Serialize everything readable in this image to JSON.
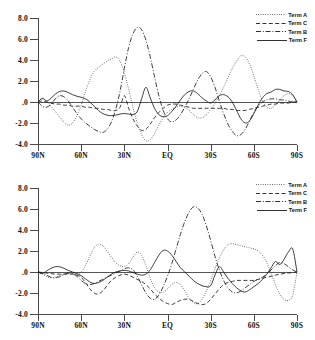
{
  "chart_data": [
    {
      "type": "line",
      "panel": "top",
      "title": "",
      "xlabel": "",
      "ylabel": "",
      "grid": false,
      "legend_position": "top-right",
      "ylim": [
        -4.0,
        8.0
      ],
      "yticks": [
        "8.0",
        "6.0",
        "4.0",
        "2.0",
        ".0",
        "-2.0",
        "-4.0"
      ],
      "ytick_values": [
        8.0,
        6.0,
        4.0,
        2.0,
        0.0,
        -2.0,
        -4.0
      ],
      "xticks": [
        "90N",
        "60N",
        "30N",
        "EQ",
        "30S",
        "60S",
        "90S"
      ],
      "xtick_values": [
        90,
        60,
        30,
        0,
        -30,
        -60,
        -90
      ],
      "x": [
        90,
        87,
        84,
        81,
        78,
        75,
        72,
        69,
        66,
        63,
        60,
        57,
        54,
        51,
        48,
        45,
        42,
        39,
        36,
        33,
        30,
        27,
        24,
        21,
        18,
        15,
        12,
        9,
        6,
        3,
        0,
        -3,
        -6,
        -9,
        -12,
        -15,
        -18,
        -21,
        -24,
        -27,
        -30,
        -33,
        -36,
        -39,
        -42,
        -45,
        -48,
        -51,
        -54,
        -57,
        -60,
        -63,
        -66,
        -69,
        -72,
        -75,
        -78,
        -81,
        -84,
        -87,
        -90
      ],
      "series": [
        {
          "name": "Term A",
          "style": "dotted",
          "values": [
            0.0,
            0.3,
            0.1,
            -0.4,
            -0.9,
            -1.4,
            -1.9,
            -2.2,
            -2.0,
            -1.3,
            -0.3,
            1.0,
            2.1,
            2.9,
            3.3,
            3.6,
            3.9,
            4.1,
            4.3,
            3.9,
            2.8,
            1.2,
            -0.5,
            -2.0,
            -3.1,
            -3.7,
            -3.6,
            -3.0,
            -2.2,
            -1.5,
            -1.0,
            -0.7,
            -0.5,
            -0.4,
            -0.5,
            -0.8,
            -1.2,
            -1.5,
            -1.5,
            -1.2,
            -0.7,
            -0.1,
            0.6,
            1.4,
            2.3,
            3.2,
            3.9,
            4.4,
            4.3,
            3.6,
            2.5,
            1.2,
            0.1,
            -0.5,
            -0.6,
            -0.3,
            0.2,
            0.6,
            0.8,
            0.6,
            0.0
          ]
        },
        {
          "name": "Term C",
          "style": "dashed",
          "values": [
            0.0,
            0.1,
            0.0,
            -0.1,
            -0.2,
            -0.2,
            -0.3,
            -0.3,
            -0.4,
            -0.4,
            -0.4,
            -0.5,
            -0.5,
            -0.6,
            -0.6,
            -0.7,
            -0.7,
            -0.8,
            -0.8,
            -0.5,
            0.6,
            -0.6,
            -1.6,
            -2.3,
            -2.7,
            -2.6,
            -2.1,
            -1.5,
            -1.0,
            -0.6,
            -0.3,
            -0.2,
            -0.2,
            -0.3,
            -0.4,
            -0.5,
            -0.6,
            -0.6,
            -0.6,
            -0.6,
            -0.6,
            -0.6,
            -0.6,
            -0.6,
            -0.7,
            -0.7,
            -0.8,
            -0.8,
            -0.8,
            -0.7,
            -0.6,
            -0.5,
            -0.4,
            -0.3,
            -0.2,
            -0.2,
            -0.1,
            -0.1,
            -0.1,
            0.0,
            0.0
          ]
        },
        {
          "name": "Term B",
          "style": "dashdot",
          "values": [
            0.0,
            -0.4,
            -0.5,
            -0.2,
            0.3,
            0.6,
            0.5,
            0.1,
            -0.5,
            -1.1,
            -1.6,
            -2.0,
            -2.3,
            -2.6,
            -2.8,
            -2.9,
            -2.6,
            -1.9,
            -0.7,
            1.0,
            3.2,
            5.2,
            6.5,
            7.1,
            6.9,
            5.9,
            4.3,
            2.4,
            0.6,
            -0.8,
            -1.6,
            -1.9,
            -1.7,
            -1.2,
            -0.5,
            0.3,
            1.2,
            2.1,
            2.7,
            2.9,
            2.4,
            1.4,
            0.1,
            -1.1,
            -2.1,
            -2.8,
            -3.2,
            -3.1,
            -2.6,
            -1.8,
            -1.0,
            -0.4,
            0.0,
            0.2,
            0.3,
            0.3,
            0.2,
            0.2,
            0.1,
            0.0,
            0.0
          ]
        },
        {
          "name": "Term F",
          "style": "solid",
          "values": [
            0.0,
            0.35,
            0.1,
            0.35,
            0.75,
            1.0,
            1.05,
            0.9,
            0.7,
            0.55,
            0.45,
            0.3,
            0.0,
            -0.4,
            -0.8,
            -1.1,
            -1.25,
            -1.3,
            -1.25,
            -1.15,
            -1.1,
            -1.15,
            -1.2,
            -0.9,
            0.3,
            1.4,
            0.4,
            -0.6,
            -1.2,
            -1.4,
            -1.3,
            -0.9,
            -0.4,
            0.2,
            0.7,
            1.0,
            1.05,
            0.8,
            0.4,
            0.1,
            -0.1,
            0.2,
            0.6,
            0.7,
            0.5,
            0.0,
            -0.8,
            -1.6,
            -2.0,
            -1.8,
            -1.1,
            -0.3,
            0.4,
            0.8,
            0.95,
            1.2,
            1.2,
            1.05,
            1.0,
            0.7,
            0.0
          ]
        }
      ]
    },
    {
      "type": "line",
      "panel": "bottom",
      "title": "",
      "xlabel": "",
      "ylabel": "",
      "grid": false,
      "legend_position": "top-right",
      "ylim": [
        -4.0,
        8.0
      ],
      "yticks": [
        "8.0",
        "6.0",
        "4.0",
        "2.0",
        ".0",
        "-2.0",
        "-4.0"
      ],
      "ytick_values": [
        8.0,
        6.0,
        4.0,
        2.0,
        0.0,
        -2.0,
        -4.0
      ],
      "xticks": [
        "90N",
        "60N",
        "30N",
        "EQ",
        "30S",
        "60S",
        "90S"
      ],
      "xtick_values": [
        90,
        60,
        30,
        0,
        -30,
        -60,
        -90
      ],
      "x": [
        90,
        87,
        84,
        81,
        78,
        75,
        72,
        69,
        66,
        63,
        60,
        57,
        54,
        51,
        48,
        45,
        42,
        39,
        36,
        33,
        30,
        27,
        24,
        21,
        18,
        15,
        12,
        9,
        6,
        3,
        0,
        -3,
        -6,
        -9,
        -12,
        -15,
        -18,
        -21,
        -24,
        -27,
        -30,
        -33,
        -36,
        -39,
        -42,
        -45,
        -48,
        -51,
        -54,
        -57,
        -60,
        -63,
        -66,
        -69,
        -72,
        -75,
        -78,
        -81,
        -84,
        -87,
        -90
      ],
      "series": [
        {
          "name": "Term A",
          "style": "dotted",
          "values": [
            0.0,
            -0.2,
            -0.45,
            -0.55,
            -0.5,
            -0.35,
            -0.2,
            -0.15,
            -0.2,
            -0.2,
            0.0,
            0.6,
            1.5,
            2.3,
            2.65,
            2.5,
            2.0,
            1.4,
            0.9,
            0.6,
            0.5,
            0.8,
            1.4,
            1.9,
            1.6,
            0.6,
            -0.6,
            -1.5,
            -1.9,
            -1.9,
            -1.6,
            -1.2,
            -1.0,
            -1.2,
            -1.8,
            -2.5,
            -2.9,
            -3.0,
            -2.6,
            -1.8,
            -0.8,
            0.3,
            1.3,
            2.1,
            2.6,
            2.7,
            2.6,
            2.5,
            2.4,
            2.3,
            2.2,
            2.0,
            1.6,
            0.9,
            -0.1,
            -1.2,
            -2.1,
            -2.6,
            -2.7,
            -2.2,
            0.0
          ]
        },
        {
          "name": "Term C",
          "style": "dashed",
          "values": [
            0.0,
            -0.05,
            -0.1,
            -0.15,
            -0.2,
            -0.2,
            -0.2,
            -0.2,
            -0.2,
            -0.3,
            -0.5,
            -1.0,
            -1.6,
            -2.0,
            -2.1,
            -1.8,
            -1.3,
            -0.8,
            -0.5,
            -0.3,
            -0.2,
            -0.3,
            -0.5,
            -0.7,
            -0.9,
            -1.2,
            -1.6,
            -2.1,
            -2.5,
            -2.8,
            -3.0,
            -3.1,
            -2.9,
            -2.7,
            -2.6,
            -2.6,
            -2.8,
            -3.0,
            -3.1,
            -3.0,
            -2.6,
            -2.1,
            -1.6,
            -1.2,
            -1.0,
            -0.9,
            -0.8,
            -0.8,
            -0.8,
            -0.8,
            -0.8,
            -0.7,
            -0.6,
            -0.5,
            -0.4,
            -0.3,
            -0.2,
            -0.15,
            -0.1,
            -0.05,
            0.0
          ]
        },
        {
          "name": "Term B",
          "style": "dashdot",
          "values": [
            0.0,
            -0.1,
            -0.3,
            -0.5,
            -0.55,
            -0.45,
            -0.25,
            -0.1,
            -0.15,
            -0.4,
            -0.8,
            -1.1,
            -1.2,
            -1.1,
            -0.9,
            -0.7,
            -0.5,
            -0.3,
            -0.1,
            0.1,
            0.3,
            0.4,
            0.2,
            -0.4,
            -1.2,
            -2.0,
            -2.5,
            -2.6,
            -2.2,
            -1.4,
            -0.4,
            0.8,
            2.2,
            3.6,
            4.8,
            5.7,
            6.2,
            6.1,
            5.5,
            4.4,
            3.0,
            1.5,
            0.2,
            -0.8,
            -1.5,
            -1.9,
            -2.0,
            -1.8,
            -1.5,
            -1.2,
            -0.9,
            -0.7,
            -0.5,
            -0.2,
            0.2,
            0.6,
            0.9,
            0.8,
            0.5,
            0.2,
            0.0
          ]
        },
        {
          "name": "Term F",
          "style": "solid",
          "values": [
            0.0,
            -0.15,
            0.1,
            0.35,
            0.5,
            0.5,
            0.35,
            0.15,
            0.0,
            -0.15,
            -0.35,
            -0.65,
            -0.95,
            -1.1,
            -1.0,
            -0.8,
            -0.5,
            -0.2,
            0.0,
            0.1,
            0.15,
            0.1,
            -0.05,
            -0.2,
            -0.3,
            -0.2,
            0.2,
            0.9,
            1.6,
            2.05,
            2.0,
            1.6,
            1.0,
            0.4,
            0.0,
            -0.4,
            -0.8,
            -1.1,
            -1.3,
            -1.4,
            -1.3,
            -0.3,
            0.5,
            0.0,
            -0.6,
            -1.1,
            -1.5,
            -1.8,
            -1.9,
            -1.7,
            -1.4,
            -1.1,
            -0.7,
            -0.2,
            0.4,
            1.0,
            0.7,
            1.2,
            1.9,
            2.2,
            0.0
          ]
        }
      ]
    }
  ],
  "legend": {
    "entries": [
      {
        "label": "Term A",
        "style": "dotted"
      },
      {
        "label": "Term C",
        "style": "dashed"
      },
      {
        "label": "Term B",
        "style": "dashdot"
      },
      {
        "label": "Term F",
        "style": "solid"
      }
    ]
  },
  "colors": {
    "line": "#1b1b1b",
    "axis": "#4a4a4a",
    "text": "#111111",
    "background": "#ffffff"
  }
}
